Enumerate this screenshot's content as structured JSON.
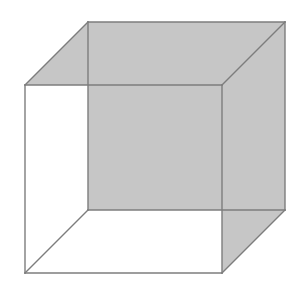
{
  "figure": {
    "type": "line-drawing",
    "canvas": {
      "width": 305,
      "height": 286,
      "background": "#ffffff"
    },
    "colors": {
      "background": "#ffffff",
      "shaded_fill": "#c6c6c6",
      "edge_stroke": "#7d7d7d",
      "edge_width": 1.4
    },
    "projection": "oblique / cavalier (back face offset up-and-right)",
    "vertices": {
      "front_top_left": [
        25,
        85
      ],
      "front_top_right": [
        222,
        85
      ],
      "front_bottom_right": [
        222,
        273
      ],
      "front_bottom_left": [
        25,
        273
      ],
      "back_top_left": [
        88,
        22
      ],
      "back_top_right": [
        285,
        22
      ],
      "back_bottom_right": [
        285,
        210
      ],
      "back_bottom_left": [
        88,
        210
      ]
    },
    "shaded_faces": [
      {
        "name": "top-face",
        "points": "88,22 285,22 222,85 25,85",
        "fill": "#c6c6c6"
      },
      {
        "name": "right-face",
        "points": "222,85 285,22 285,210 222,273",
        "fill": "#c6c6c6"
      },
      {
        "name": "back-face",
        "points": "88,22 285,22 285,210 88,210",
        "fill": "#c6c6c6"
      }
    ],
    "edges": [
      {
        "name": "front-top-edge",
        "d": "M 25,85 L 222,85"
      },
      {
        "name": "front-right-edge",
        "d": "M 222,85 L 222,273"
      },
      {
        "name": "front-bottom-edge",
        "d": "M 222,273 L 25,273"
      },
      {
        "name": "front-left-edge",
        "d": "M 25,273 L 25,85"
      },
      {
        "name": "back-top-edge",
        "d": "M 88,22 L 285,22"
      },
      {
        "name": "back-right-edge",
        "d": "M 285,22 L 285,210"
      },
      {
        "name": "back-bottom-edge",
        "d": "M 285,210 L 88,210"
      },
      {
        "name": "back-left-edge",
        "d": "M 88,210 L 88,22"
      },
      {
        "name": "connector-top-left",
        "d": "M 25,85 L 88,22"
      },
      {
        "name": "connector-top-right",
        "d": "M 222,85 L 285,22"
      },
      {
        "name": "connector-bottom-right",
        "d": "M 222,273 L 285,210"
      },
      {
        "name": "connector-bottom-left",
        "d": "M 25,273 L 88,210"
      }
    ]
  }
}
